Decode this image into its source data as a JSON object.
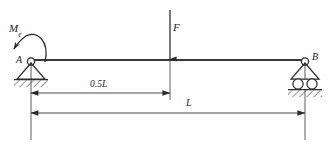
{
  "diagram": {
    "type": "engineering-beam-diagram",
    "labels": {
      "moment_symbol": "M",
      "moment_subscript": "e",
      "force": "F",
      "support_left": "A",
      "support_right": "B",
      "dimension_half": "0.5L",
      "dimension_full": "L"
    },
    "colors": {
      "line": "#2b2b2b",
      "beam": "#3a3a3a",
      "hatch": "#404040",
      "background": "#ffffff",
      "text": "#222222"
    },
    "geometry": {
      "beam_left_x": 30,
      "beam_right_x": 306,
      "beam_y": 60,
      "force_x": 170,
      "dimension_half_y": 93,
      "dimension_full_y": 113
    },
    "elements": {
      "support_left_type": "pin-support",
      "support_right_type": "roller-support",
      "moment_direction": "counterclockwise",
      "force_direction": "downward"
    }
  }
}
